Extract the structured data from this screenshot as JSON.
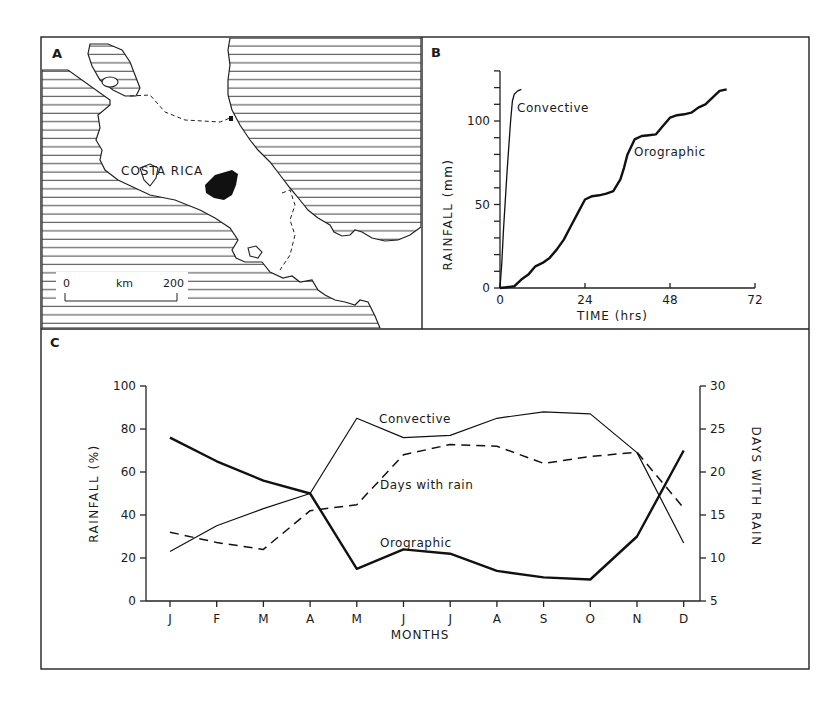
{
  "figure": {
    "panels": {
      "A": {
        "label": "A",
        "map_label": "COSTA RICA",
        "scale_bar": {
          "start": "0",
          "unit": "km",
          "end": "200"
        }
      },
      "B": {
        "label": "B"
      },
      "C": {
        "label": "C"
      }
    }
  },
  "chart_data": [
    {
      "panel": "B",
      "type": "line",
      "title": "",
      "xlabel": "TIME (hrs)",
      "ylabel": "RAINFALL (mm)",
      "xlim": [
        0,
        72
      ],
      "ylim": [
        0,
        130
      ],
      "xticks": [
        0,
        24,
        48,
        72
      ],
      "yticks_labeled": [
        0,
        50,
        100
      ],
      "yticks_minor_step": 10,
      "grid": false,
      "series": [
        {
          "name": "Convective",
          "x": [
            0,
            0.5,
            1,
            2,
            3,
            3.5,
            4,
            5,
            6
          ],
          "y": [
            0,
            15,
            35,
            70,
            100,
            112,
            116,
            118,
            119
          ]
        },
        {
          "name": "Orographic",
          "x": [
            0,
            2,
            4,
            6,
            8,
            10,
            12,
            14,
            16,
            18,
            20,
            22,
            24,
            26,
            28,
            30,
            32,
            34,
            35,
            36,
            38,
            40,
            42,
            44,
            46,
            48,
            50,
            52,
            54,
            56,
            58,
            60,
            62,
            64
          ],
          "y": [
            0,
            0.5,
            1,
            5,
            8,
            13,
            15,
            18,
            23,
            29,
            37,
            45,
            53,
            55,
            55.5,
            56.5,
            58,
            65,
            72,
            80,
            89,
            91,
            91.5,
            92,
            97,
            102,
            103.5,
            104,
            105,
            108,
            110,
            114,
            118,
            119
          ]
        }
      ],
      "annotations": [
        "Convective",
        "Orographic"
      ]
    },
    {
      "panel": "C",
      "type": "line",
      "title": "",
      "xlabel": "MONTHS",
      "ylabel": "RAINFALL (%)",
      "y2label": "DAYS WITH RAIN",
      "categories": [
        "J",
        "F",
        "M",
        "A",
        "M",
        "J",
        "J",
        "A",
        "S",
        "O",
        "N",
        "D"
      ],
      "ylim": [
        0,
        100
      ],
      "yticks": [
        0,
        20,
        40,
        60,
        80,
        100
      ],
      "y2lim": [
        5,
        30
      ],
      "y2ticks": [
        5,
        10,
        15,
        20,
        25,
        30
      ],
      "grid": false,
      "series": [
        {
          "name": "Convective",
          "axis": "left",
          "style": "thin-solid",
          "values": [
            23,
            35,
            43,
            50,
            85,
            76,
            77,
            85,
            88,
            87,
            69,
            27
          ]
        },
        {
          "name": "Orographic",
          "axis": "left",
          "style": "thick-solid",
          "values": [
            76,
            65,
            56,
            50,
            15,
            24,
            22,
            14,
            11,
            10,
            30,
            70
          ]
        },
        {
          "name": "Days with rain",
          "axis": "right",
          "style": "dashed",
          "values": [
            13,
            11.8,
            11,
            15.5,
            16.2,
            22,
            23.2,
            23,
            21,
            21.8,
            22.3,
            15.8
          ]
        }
      ],
      "annotations": [
        "Convective",
        "Days with rain",
        "Orographic"
      ]
    }
  ]
}
